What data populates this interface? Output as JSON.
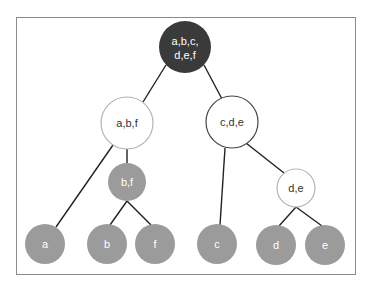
{
  "diagram": {
    "type": "tree",
    "colors": {
      "root_fill": "#3a3a3a",
      "root_text": "#ffffff",
      "gray_fill": "#9b9b9b",
      "gray_text": "#ffffff",
      "white_fill": "#ffffff",
      "white_text": "#333333",
      "edge": "#222222",
      "frame": "#8a8a8a"
    },
    "nodes": [
      {
        "id": "root",
        "lines": [
          "a,b,c,",
          "d,e,f"
        ],
        "style": "dark"
      },
      {
        "id": "abf",
        "lines": [
          "a,b,f"
        ],
        "style": "white"
      },
      {
        "id": "cde",
        "lines": [
          "c,d,e"
        ],
        "style": "white"
      },
      {
        "id": "bf",
        "lines": [
          "b,f"
        ],
        "style": "gray"
      },
      {
        "id": "de",
        "lines": [
          "d,e"
        ],
        "style": "white"
      },
      {
        "id": "a",
        "lines": [
          "a"
        ],
        "style": "gray"
      },
      {
        "id": "b",
        "lines": [
          "b"
        ],
        "style": "gray"
      },
      {
        "id": "f",
        "lines": [
          "f"
        ],
        "style": "gray"
      },
      {
        "id": "c",
        "lines": [
          "c"
        ],
        "style": "gray"
      },
      {
        "id": "d",
        "lines": [
          "d"
        ],
        "style": "gray"
      },
      {
        "id": "e",
        "lines": [
          "e"
        ],
        "style": "gray"
      }
    ],
    "edges": [
      [
        "root",
        "abf"
      ],
      [
        "root",
        "cde"
      ],
      [
        "abf",
        "a"
      ],
      [
        "abf",
        "bf"
      ],
      [
        "bf",
        "b"
      ],
      [
        "bf",
        "f"
      ],
      [
        "cde",
        "c"
      ],
      [
        "cde",
        "de"
      ],
      [
        "de",
        "d"
      ],
      [
        "de",
        "e"
      ]
    ]
  }
}
